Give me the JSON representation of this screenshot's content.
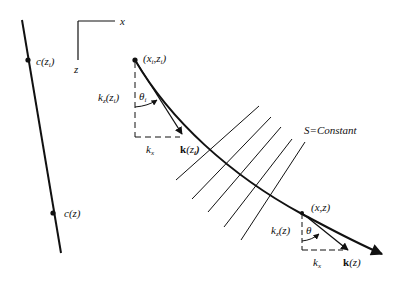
{
  "diagram": {
    "axes": {
      "x_label": "x",
      "z_label": "z"
    },
    "velocity_profile": {
      "point_top_label_fn": "c(z",
      "point_top_label_sub": "i",
      "point_top_label_close": ")",
      "point_bottom_label": "c(z)"
    },
    "ray": {
      "start_label_open": "(x",
      "start_label_sub1": "i",
      "start_label_mid": ",z",
      "start_label_sub2": "i",
      "start_label_close": ")",
      "end_point_label": "(x,z)"
    },
    "start_decomposition": {
      "kz_label_fn": "k",
      "kz_label_sub": "z",
      "kz_label_arg_open": "(z",
      "kz_label_arg_sub": "i",
      "kz_label_arg_close": ")",
      "theta_label": "θ",
      "theta_sub": "i",
      "kx_label": "k",
      "kx_sub": "x",
      "k_vector_label": "k",
      "k_vector_arg_open": "(z",
      "k_vector_arg_sub": "i",
      "k_vector_arg_close": ")"
    },
    "end_decomposition": {
      "kz_label_fn": "k",
      "kz_label_sub": "z",
      "kz_label_arg": "(z)",
      "theta_label": "θ",
      "kx_label": "k",
      "kx_sub": "x",
      "k_vector_label": "k",
      "k_vector_arg": "(z)"
    },
    "wavefront_label": "S=Constant",
    "wavefront_count": 5
  }
}
